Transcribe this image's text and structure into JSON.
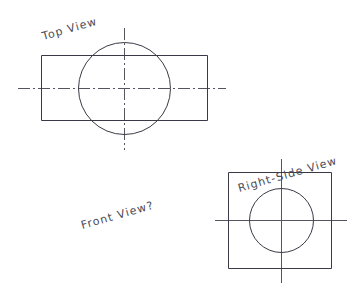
{
  "drawing": {
    "title": "Orthographic Projection Exercise",
    "background_color": "#ffffff",
    "line_color": "#3a3a46",
    "centerline_color": "#55555f",
    "labels": {
      "top_view": "Top View",
      "front_view": "Front View?",
      "right_side_view": "Right-Side View"
    },
    "views": [
      {
        "name": "top-view",
        "label": "Top View",
        "shapes": [
          {
            "type": "rect",
            "x": 41,
            "y": 55,
            "width": 166,
            "height": 65
          },
          {
            "type": "circle",
            "cx": 124,
            "cy": 88,
            "r": 46
          }
        ],
        "centerlines": [
          {
            "type": "horizontal",
            "x1": 18,
            "y1": 88,
            "x2": 226,
            "y2": 88
          },
          {
            "type": "vertical",
            "x1": 124,
            "y1": 28,
            "x2": 124,
            "y2": 150
          }
        ]
      },
      {
        "name": "right-side-view",
        "label": "Right-Side View",
        "shapes": [
          {
            "type": "rect",
            "x": 228,
            "y": 172,
            "width": 103,
            "height": 96
          },
          {
            "type": "circle",
            "cx": 281,
            "cy": 220,
            "r": 32
          }
        ],
        "centerlines": [
          {
            "type": "horizontal",
            "x1": 215,
            "y1": 220,
            "x2": 347,
            "y2": 220
          },
          {
            "type": "vertical",
            "x1": 281,
            "y1": 159,
            "x2": 281,
            "y2": 283
          }
        ]
      },
      {
        "name": "front-view",
        "label": "Front View?",
        "shapes": [],
        "centerlines": []
      }
    ]
  }
}
